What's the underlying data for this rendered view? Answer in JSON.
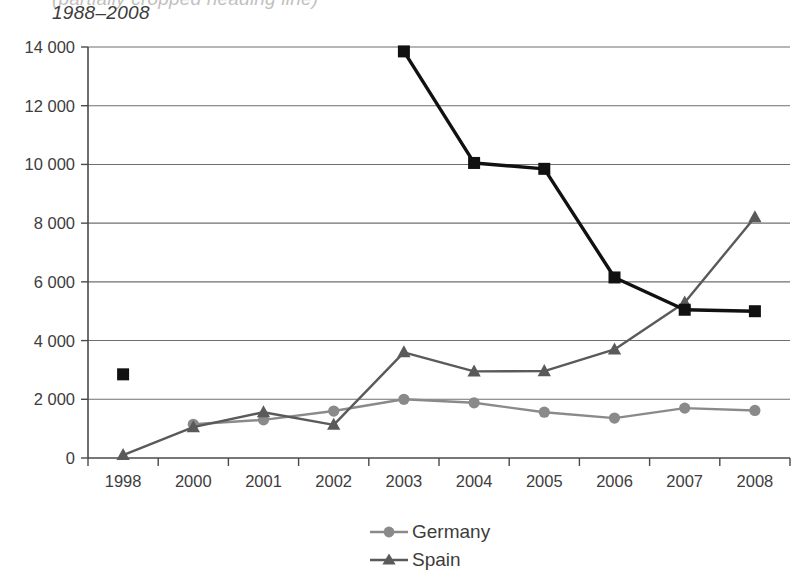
{
  "title": {
    "line1": "(partially cropped heading line)",
    "line2": "1988–2008"
  },
  "legend": {
    "position": "bottom-center",
    "items": [
      {
        "label": "Germany",
        "marker": "circle-marker-icon",
        "color": "#8a8a8a"
      },
      {
        "label": "Spain",
        "marker": "triangle-marker-icon",
        "color": "#5a5a5a"
      }
    ]
  },
  "axes": {
    "y_ticks": [
      "0",
      "2 000",
      "4 000",
      "6 000",
      "8 000",
      "10 000",
      "12 000",
      "14 000"
    ],
    "x_ticks": [
      "1998",
      "2000",
      "2001",
      "2002",
      "2003",
      "2004",
      "2005",
      "2006",
      "2007",
      "2008"
    ]
  },
  "chart_data": {
    "type": "line",
    "title": "1988–2008",
    "xlabel": "",
    "ylabel": "",
    "ylim": [
      0,
      14000
    ],
    "yticks": [
      0,
      2000,
      4000,
      6000,
      8000,
      10000,
      12000,
      14000
    ],
    "ytick_labels": [
      "0",
      "2 000",
      "4 000",
      "6 000",
      "8 000",
      "10 000",
      "12 000",
      "14 000"
    ],
    "grid": "horizontal",
    "legend_position": "bottom-center",
    "categories": [
      "1998",
      "2000",
      "2001",
      "2002",
      "2003",
      "2004",
      "2005",
      "2006",
      "2007",
      "2008"
    ],
    "series": [
      {
        "name": "Germany",
        "color": "#8a8a8a",
        "marker": "circle",
        "values": [
          null,
          1150,
          1300,
          1600,
          2000,
          1880,
          1560,
          1360,
          1700,
          1620
        ]
      },
      {
        "name": "Spain",
        "color": "#5a5a5a",
        "marker": "triangle",
        "values": [
          100,
          1050,
          1560,
          1130,
          3600,
          2950,
          2960,
          3700,
          5300,
          8200
        ]
      },
      {
        "name": "",
        "color": "#111111",
        "marker": "square",
        "values": [
          2850,
          null,
          null,
          null,
          13850,
          10050,
          9850,
          6150,
          5050,
          5000
        ]
      }
    ]
  },
  "colors": {
    "germany": "#8a8a8a",
    "spain": "#5a5a5a",
    "black_series": "#111111",
    "gridline": "#6f6f6f",
    "axis": "#4a4a4a",
    "text": "#3d3d3d",
    "background": "#ffffff"
  }
}
